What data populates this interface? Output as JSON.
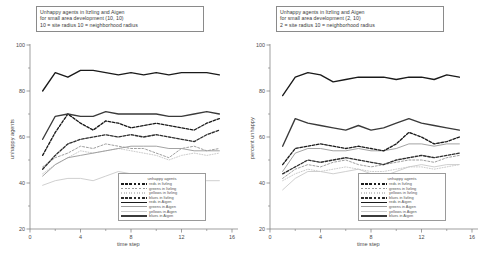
{
  "figure": {
    "background": "#ffffff",
    "panel_count": 2
  },
  "panels": [
    {
      "id": "left",
      "title_lines": [
        "Unhappy agents in Itzling and Aigen",
        "for small area development (10, 10)",
        "10 = site radius  10 = neighborhood radius"
      ],
      "ylabel": "unhappy agents",
      "xlabel": "time step"
    },
    {
      "id": "right",
      "title_lines": [
        "Unhappy agents in Itzling and Aigen",
        "for small area development (2, 10)",
        "2 = site radius  10 = neighborhood radius"
      ],
      "ylabel": "percent unhappy",
      "xlabel": "time step"
    }
  ],
  "legend": {
    "title": "unhappy agents",
    "entries": [
      {
        "label": "reds in Itzling",
        "color": "#1a1a1a",
        "style": "dashed-thick"
      },
      {
        "label": "greens in Itzling",
        "color": "#9a9a9a",
        "style": "dashed-thin"
      },
      {
        "label": "yellows in Itzling",
        "color": "#c8c8c8",
        "style": "dotted"
      },
      {
        "label": "blues in Itzling",
        "color": "#2e2e2e",
        "style": "dashed-thick"
      },
      {
        "label": "reds in Aigen",
        "color": "#1a1a1a",
        "style": "solid-thick"
      },
      {
        "label": "greens in Aigen",
        "color": "#9e9e9e",
        "style": "solid-thin"
      },
      {
        "label": "yellows in Aigen",
        "color": "#cccccc",
        "style": "solid-thin"
      },
      {
        "label": "blues in Aigen",
        "color": "#3a3a3a",
        "style": "solid-thick"
      }
    ]
  },
  "chart_data": {
    "type": "line",
    "title": "Unhappy agents in Itzling and Aigen for small area development",
    "xlabel": "time step",
    "ylabel": "unhappy agents",
    "xlim": [
      0,
      16
    ],
    "ylim": [
      20,
      100
    ],
    "xticks": [
      0,
      4,
      8,
      12,
      16
    ],
    "yticks": [
      20,
      40,
      60,
      80,
      100
    ],
    "xtick_labels": [
      "0",
      "4",
      "8",
      "12",
      "16"
    ],
    "ytick_labels": [
      "20",
      "40",
      "60",
      "80",
      "100"
    ],
    "grid": false,
    "legend_position": "lower-right-inside",
    "x": [
      1,
      2,
      3,
      4,
      5,
      6,
      7,
      8,
      9,
      10,
      11,
      12,
      13,
      14,
      15
    ],
    "panels": [
      {
        "id": "left",
        "ylabel": "unhappy agents",
        "series": [
          {
            "name": "reds in Aigen",
            "color": "#1a1a1a",
            "style": "solid-thick",
            "values": [
              80,
              88,
              86,
              89,
              89,
              88,
              87,
              88,
              87,
              88,
              87,
              88,
              88,
              88,
              87
            ]
          },
          {
            "name": "blues in Aigen",
            "color": "#3a3a3a",
            "style": "solid-thick",
            "values": [
              59,
              69,
              70,
              69,
              69,
              71,
              70,
              70,
              70,
              70,
              69,
              69,
              70,
              71,
              70
            ]
          },
          {
            "name": "reds in Itzling",
            "color": "#1a1a1a",
            "style": "dashed-thick",
            "values": [
              52,
              62,
              70,
              66,
              63,
              67,
              66,
              64,
              65,
              66,
              65,
              64,
              63,
              66,
              68
            ]
          },
          {
            "name": "blues in Itzling",
            "color": "#2e2e2e",
            "style": "dashed-thick",
            "values": [
              46,
              52,
              57,
              59,
              60,
              61,
              60,
              61,
              60,
              61,
              60,
              59,
              58,
              61,
              63
            ]
          },
          {
            "name": "greens in Itzling",
            "color": "#9a9a9a",
            "style": "dashed-thin",
            "values": [
              47,
              51,
              53,
              56,
              55,
              57,
              56,
              55,
              55,
              53,
              51,
              55,
              56,
              54,
              55
            ]
          },
          {
            "name": "greens in Aigen",
            "color": "#9e9e9e",
            "style": "solid-thin",
            "values": [
              43,
              48,
              51,
              52,
              53,
              54,
              55,
              56,
              56,
              56,
              55,
              55,
              54,
              54,
              54
            ]
          },
          {
            "name": "yellows in Itzling",
            "color": "#c8c8c8",
            "style": "dotted",
            "values": [
              44,
              48,
              51,
              54,
              53,
              54,
              55,
              54,
              53,
              52,
              50,
              52,
              53,
              52,
              53
            ]
          },
          {
            "name": "yellows in Aigen",
            "color": "#cccccc",
            "style": "solid-thin",
            "values": [
              39,
              41,
              42,
              42,
              41,
              43,
              45,
              44,
              43,
              44,
              43,
              42,
              42,
              41,
              41
            ]
          }
        ]
      },
      {
        "id": "right",
        "ylabel": "percent unhappy",
        "series": [
          {
            "name": "reds in Aigen",
            "color": "#1a1a1a",
            "style": "solid-thick",
            "values": [
              78,
              86,
              88,
              87,
              84,
              85,
              86,
              86,
              86,
              85,
              86,
              86,
              85,
              87,
              86
            ]
          },
          {
            "name": "blues in Aigen",
            "color": "#3a3a3a",
            "style": "solid-thick",
            "values": [
              56,
              68,
              66,
              65,
              64,
              63,
              65,
              63,
              64,
              66,
              68,
              66,
              65,
              64,
              63
            ]
          },
          {
            "name": "reds in Itzling",
            "color": "#1a1a1a",
            "style": "dashed-thick",
            "values": [
              48,
              55,
              56,
              57,
              56,
              55,
              56,
              55,
              54,
              57,
              62,
              60,
              57,
              58,
              60
            ]
          },
          {
            "name": "greens in Aigen",
            "color": "#9e9e9e",
            "style": "solid-thin",
            "values": [
              45,
              53,
              55,
              55,
              54,
              54,
              55,
              54,
              54,
              55,
              57,
              57,
              56,
              57,
              57
            ]
          },
          {
            "name": "blues in Itzling",
            "color": "#2e2e2e",
            "style": "dashed-thick",
            "values": [
              44,
              47,
              50,
              49,
              50,
              51,
              50,
              49,
              48,
              50,
              51,
              52,
              51,
              52,
              53
            ]
          },
          {
            "name": "greens in Itzling",
            "color": "#9a9a9a",
            "style": "dashed-thin",
            "values": [
              42,
              46,
              48,
              47,
              49,
              50,
              48,
              47,
              48,
              49,
              50,
              50,
              49,
              51,
              52
            ]
          },
          {
            "name": "yellows in Itzling",
            "color": "#c8c8c8",
            "style": "dotted",
            "values": [
              41,
              44,
              46,
              45,
              46,
              47,
              46,
              45,
              45,
              46,
              47,
              47,
              46,
              47,
              48
            ]
          },
          {
            "name": "yellows in Aigen",
            "color": "#cccccc",
            "style": "solid-thin",
            "values": [
              37,
              42,
              45,
              45,
              44,
              45,
              46,
              44,
              43,
              45,
              47,
              48,
              47,
              48,
              48
            ]
          }
        ]
      }
    ]
  }
}
